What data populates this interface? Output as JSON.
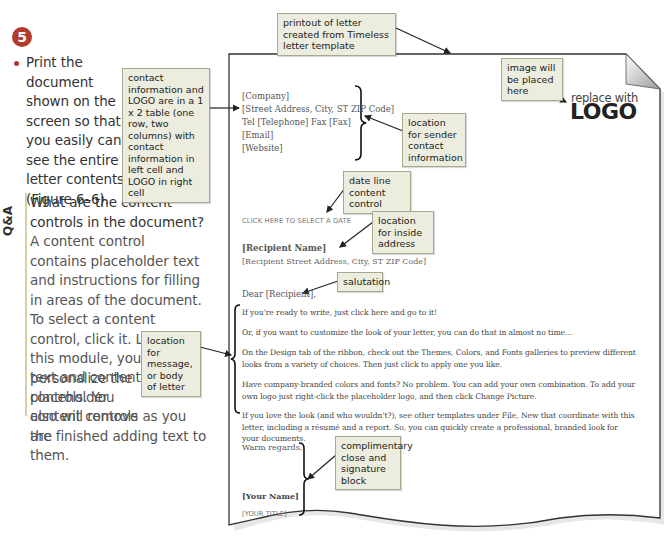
{
  "step": {
    "number": "5",
    "instruction": "Print the document shown on the screen so that you easily can see the entire letter contents (Figure 6–6).",
    "accent_color": "#b23a2a"
  },
  "qa": {
    "label": "Q&A",
    "question": "What are the content controls in the document?",
    "answer_main": "A content control contains placeholder text and instructions for filling in areas of the document. To select a content control, click it. Later in this module, you will personalize the placeholder",
    "answer_line_a": "text and content controls. You also will remove the",
    "answer_line_b": "content controls as you are finished adding text to them."
  },
  "callouts": {
    "printout": "printout of letter created from Timeless letter template",
    "table": "contact information and LOGO are in a 1 x 2 table (one row, two columns) with contact information in left cell and LOGO in right cell",
    "image": "image will be placed here",
    "sender": "location for sender contact information",
    "date": "date line content control",
    "inside_address": "location for inside address",
    "salutation": "salutation",
    "body": "location for message, or body of letter",
    "close": "complimentary close and signature block"
  },
  "letter": {
    "sender_lines": [
      "[Company]",
      "[Street Address, City, ST ZIP Code]",
      "Tel [Telephone] Fax [Fax]",
      "[Email]",
      "[Website]"
    ],
    "logo_small": "replace with",
    "logo_big": "LOGO",
    "date_placeholder": "CLICK HERE TO SELECT A DATE",
    "recipient_name": "[Recipient Name]",
    "recipient_address": "[Recipient Street Address, City, ST ZIP Code]",
    "salutation": "Dear [Recipient],",
    "body_paragraphs": [
      "If you're ready to write, just click here and go to it!",
      "Or, if you want to customize the look of your letter, you can do that in almost no time...",
      "On the Design tab of the ribbon, check out the Themes, Colors, and Fonts galleries to preview different looks from a variety of choices. Then just click to apply one you like.",
      "Have company-branded colors and fonts? No problem. You can add your own combination. To add your own logo just right-click the placeholder logo, and then click Change Picture.",
      "If you love the look (and who wouldn't?), see other templates under File, New that coordinate with this letter, including a résumé and a report. So, you can quickly create a professional, branded look for your documents."
    ],
    "closing": "Warm regards,",
    "your_name": "[Your Name]",
    "your_title": "[YOUR TITLE]"
  }
}
